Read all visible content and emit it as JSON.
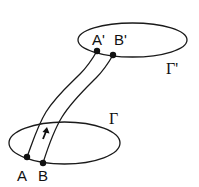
{
  "diagram": {
    "colors": {
      "stroke": "#1a1a1a",
      "background": "#ffffff"
    },
    "curves": [
      {
        "id": "gamma",
        "label": "Γ",
        "shape": "ellipse",
        "cx": 64.5,
        "cy": 143,
        "rx": 55.5,
        "ry": 21,
        "label_pos": [
          109,
          124
        ]
      },
      {
        "id": "gamma-prime",
        "label": "Γ'",
        "shape": "ellipse",
        "cx": 132.5,
        "cy": 40,
        "rx": 54.5,
        "ry": 17,
        "label_pos": [
          166,
          74
        ]
      }
    ],
    "points": [
      {
        "id": "A",
        "label": "A",
        "x": 27,
        "y": 157,
        "label_pos": [
          17,
          181
        ]
      },
      {
        "id": "B",
        "label": "B",
        "x": 43,
        "y": 163,
        "label_pos": [
          38,
          181
        ]
      },
      {
        "id": "A-prime",
        "label": "A'",
        "x": 97,
        "y": 51,
        "label_pos": [
          92,
          45
        ]
      },
      {
        "id": "B-prime",
        "label": "B'",
        "x": 113,
        "y": 55,
        "label_pos": [
          114,
          45
        ]
      }
    ],
    "strip": {
      "edges": [
        "A→A'",
        "B→B'"
      ],
      "orientation_arrow": "up"
    }
  }
}
